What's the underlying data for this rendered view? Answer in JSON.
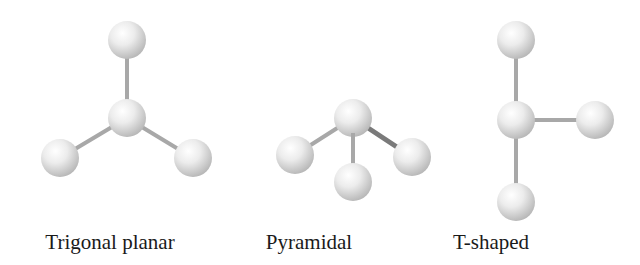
{
  "figure": {
    "colors": {
      "background": "#ffffff",
      "atom_highlight": "#ffffff",
      "atom_mid": "#e6e6e6",
      "atom_shadow": "#b8b8b8",
      "bond": "#a8a8a8",
      "bond_dark": "#7a7a7a",
      "label_text": "#1a1a1a"
    },
    "models": [
      {
        "name": "Trigonal planar",
        "label_center_x": 110,
        "atoms": [
          {
            "role": "central",
            "x": 127,
            "y": 118,
            "r": 19
          },
          {
            "role": "top",
            "x": 127,
            "y": 40,
            "r": 19
          },
          {
            "role": "left",
            "x": 60,
            "y": 158,
            "r": 19
          },
          {
            "role": "right",
            "x": 193,
            "y": 158,
            "r": 19
          }
        ]
      },
      {
        "name": "Pyramidal",
        "label_center_x": 309,
        "atoms": [
          {
            "role": "central",
            "x": 353,
            "y": 118,
            "r": 19
          },
          {
            "role": "left",
            "x": 295,
            "y": 155,
            "r": 19
          },
          {
            "role": "bottom",
            "x": 353,
            "y": 182,
            "r": 19
          },
          {
            "role": "right",
            "x": 412,
            "y": 157,
            "r": 19
          }
        ]
      },
      {
        "name": "T-shaped",
        "label_center_x": 491,
        "atoms": [
          {
            "role": "central",
            "x": 516,
            "y": 120,
            "r": 19
          },
          {
            "role": "top",
            "x": 516,
            "y": 40,
            "r": 19
          },
          {
            "role": "right",
            "x": 595,
            "y": 120,
            "r": 19
          },
          {
            "role": "bottom",
            "x": 516,
            "y": 202,
            "r": 19
          }
        ]
      }
    ]
  }
}
